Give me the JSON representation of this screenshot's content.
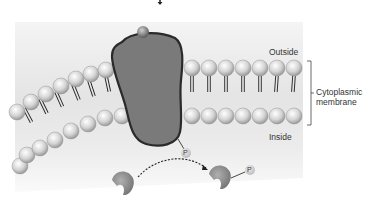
{
  "labels": {
    "outside": "Outside",
    "inside": "Inside",
    "membrane_line1": "Cytoplasmic",
    "membrane_line2": "membrane",
    "phospho_protein": "P",
    "phospho_target": "P"
  },
  "colors": {
    "background_panel": "#e6e6e6",
    "protein_fill": "#7a7a7a",
    "protein_outline": "#2a2a2a",
    "lipid_head": "#d8d8d8",
    "lipid_tail": "#222222",
    "substrate": "#8c8c8c",
    "text": "#333333"
  },
  "icons": {
    "top_arrow": "arrow-down-icon",
    "ligand": "ligand-sphere-icon",
    "transfer_arrow": "dashed-curved-arrow-icon"
  }
}
